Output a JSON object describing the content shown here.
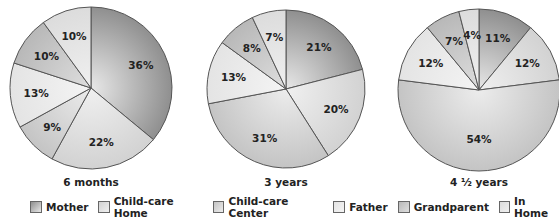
{
  "chart_data": [
    {
      "type": "pie",
      "title": "6 months",
      "categories": [
        "Mother",
        "Child-care Home",
        "Child-care Center",
        "Father",
        "Grandparent",
        "In Home"
      ],
      "values": [
        36,
        22,
        9,
        13,
        10,
        10
      ],
      "labels": [
        "36%",
        "22%",
        "9%",
        "13%",
        "10%",
        "10%"
      ],
      "center": [
        91,
        88
      ],
      "radius": 81
    },
    {
      "type": "pie",
      "title": "3 years",
      "categories": [
        "Mother",
        "Child-care Home",
        "Child-care Center",
        "Father",
        "Grandparent",
        "In Home"
      ],
      "values": [
        21,
        20,
        31,
        13,
        8,
        7
      ],
      "labels": [
        "21%",
        "20%",
        "31%",
        "13%",
        "8%",
        "7%"
      ],
      "center": [
        286,
        89
      ],
      "radius": 79
    },
    {
      "type": "pie",
      "title": "4 ½ years",
      "categories": [
        "Mother",
        "Child-care Home",
        "Child-care Center",
        "Father",
        "Grandparent",
        "In Home"
      ],
      "values": [
        11,
        12,
        54,
        12,
        7,
        4
      ],
      "labels": [
        "11%",
        "12%",
        "54%",
        "12%",
        "7%",
        "4%"
      ],
      "center": [
        479,
        90
      ],
      "radius": 81
    }
  ],
  "legend": {
    "position": "bottom",
    "items": [
      {
        "label": "Mother",
        "color": "#8f8f8f"
      },
      {
        "label": "Child-care Home",
        "color": "#d2d2d2"
      },
      {
        "label": "Child-care Center",
        "color": "#c4c4c4"
      },
      {
        "label": "Father",
        "color": "#e4e4e4"
      },
      {
        "label": "Grandparent",
        "color": "#b8b8b8"
      },
      {
        "label": "In Home",
        "color": "#dcdcdc"
      }
    ]
  },
  "slice_colors": [
    "#8f8f8f",
    "#d2d2d2",
    "#c4c4c4",
    "#e4e4e4",
    "#b8b8b8",
    "#dcdcdc"
  ],
  "slice_colors_light": [
    "#e8e8e8",
    "#f0f0f0",
    "#ececec",
    "#f4f4f4",
    "#dedede",
    "#f0f0f0"
  ]
}
